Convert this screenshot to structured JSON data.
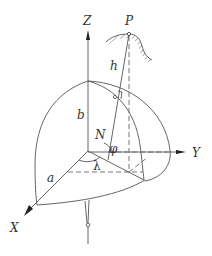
{
  "diagram": {
    "type": "geodetic-ellipsoid-coordinates",
    "axes": {
      "x_label": "X",
      "y_label": "Y",
      "z_label": "Z"
    },
    "labels": {
      "point": "P",
      "height": "h",
      "semi_major": "a",
      "semi_minor": "b",
      "normal": "N",
      "latitude": "φ",
      "longitude": "λ"
    },
    "colors": {
      "line": "#555555",
      "text": "#333333",
      "background": "#ffffff"
    }
  }
}
